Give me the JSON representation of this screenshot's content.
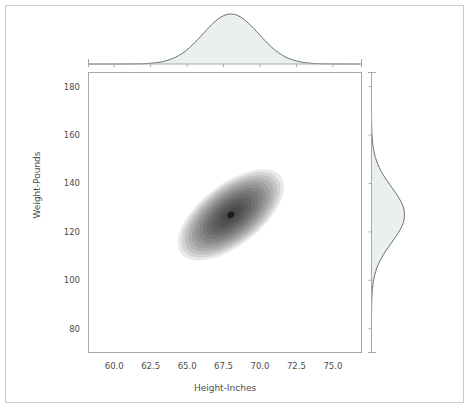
{
  "figure": {
    "background_color": "#ffffff",
    "border_color": "#c9c9c9",
    "axis_color": "#a8a8a8",
    "text_color": "#4d4d4d",
    "kde_line_color": "#5c6b73",
    "kde_fill_color": "#eceff0",
    "density_color": "#000000"
  },
  "chart_data": {
    "type": "heatmap",
    "title": "",
    "subtitle": "",
    "xlabel": "Height-Inches",
    "ylabel": "Weight-Pounds",
    "xlim": [
      58.2,
      77.0
    ],
    "ylim": [
      70.0,
      186.0
    ],
    "xticks": [
      60.0,
      62.5,
      65.0,
      67.5,
      70.0,
      72.5,
      75.0
    ],
    "xtick_labels": [
      "60.0",
      "62.5",
      "65.0",
      "67.5",
      "70.0",
      "72.5",
      "75.0"
    ],
    "yticks": [
      80,
      100,
      120,
      140,
      160,
      180
    ],
    "ytick_labels": [
      "80",
      "100",
      "120",
      "140",
      "160",
      "180"
    ],
    "grid": false,
    "legend": null,
    "plot_kind": "joint-kde-with-marginals",
    "joint": {
      "description": "Bivariate kernel density estimate shown as filled grayscale contour levels; darker = higher density",
      "center_x": 68.0,
      "center_y": 127.0,
      "sigma_x": 1.9,
      "sigma_y": 11.5,
      "correlation": 0.5,
      "tilt_degrees": 38,
      "n_contour_levels": 14,
      "colormap": "Greys"
    },
    "marginal_x": {
      "type": "line",
      "orientation": "horizontal",
      "description": "Univariate KDE of Height-Inches across top of joint axes",
      "mean": 68.0,
      "std": 1.9,
      "peak_x": 68.0
    },
    "marginal_y": {
      "type": "line",
      "orientation": "vertical",
      "description": "Univariate KDE of Weight-Pounds along right of joint axes",
      "mean": 127.0,
      "std": 11.5,
      "peak_y": 127.0
    }
  }
}
